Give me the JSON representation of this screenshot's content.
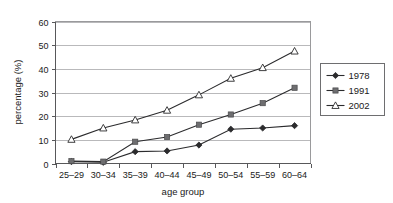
{
  "chart_data": {
    "type": "line",
    "title": "",
    "xlabel": "age group",
    "ylabel": "percentage (%)",
    "categories": [
      "25–29",
      "30–34",
      "35–39",
      "40–44",
      "45–49",
      "50–54",
      "55–59",
      "60–64"
    ],
    "ylim": [
      0,
      60
    ],
    "yticks": [
      0,
      10,
      20,
      30,
      40,
      50,
      60
    ],
    "ytick_labels": [
      "0",
      "10",
      "20",
      "30",
      "40",
      "50",
      "60"
    ],
    "grid": "horizontal",
    "legend_position": "right",
    "series": [
      {
        "name": "1978",
        "marker": "filled-diamond",
        "color": "#2b2b2d",
        "values": [
          0.8,
          0.5,
          5.0,
          5.3,
          7.8,
          14.5,
          15.0,
          16.0
        ]
      },
      {
        "name": "1991",
        "marker": "filled-square",
        "color": "#6e6e70",
        "values": [
          1.0,
          0.8,
          9.2,
          11.2,
          16.4,
          20.7,
          25.5,
          32.0
        ]
      },
      {
        "name": "2002",
        "marker": "open-triangle",
        "color": "#2b2b2d",
        "values": [
          10.2,
          15.0,
          18.4,
          22.5,
          29.0,
          36.0,
          40.5,
          47.5
        ]
      }
    ]
  },
  "legend": {
    "entries": [
      {
        "label": "1978"
      },
      {
        "label": "1991"
      },
      {
        "label": "2002"
      }
    ]
  }
}
